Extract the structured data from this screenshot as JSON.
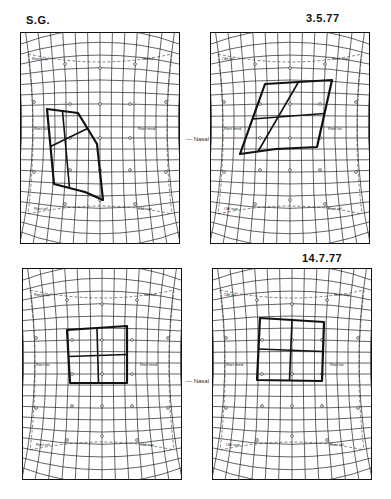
{
  "figure": {
    "subject_label": "S.G.",
    "top_left_title": "S.G.",
    "top_right_title": "3.5.77",
    "bottom_left_title": "",
    "bottom_right_title": "14.7.77",
    "nasal_label_top": "Nasal",
    "nasal_label_bottom": "Nasal"
  },
  "muscle_labels": {
    "rect_sup": "Rect sup",
    "obl_inf": "Obl inf",
    "rect_lat": "Rect lat",
    "rect_med": "Rect med",
    "obl_sup": "Obl sup",
    "rect_inf": "Rect inf"
  },
  "panels": [
    {
      "id": "top-left",
      "title": "S.G.",
      "labels": {
        "tl": "Rect sup",
        "tr": "Obl inf",
        "ml": "Rect lat",
        "mr": "Rect med",
        "bl": "Rect inf",
        "br": "Obl sup"
      },
      "plot": [
        [
          27,
          77
        ],
        [
          58,
          81
        ],
        [
          77,
          112
        ],
        [
          83,
          168
        ],
        [
          65,
          160
        ],
        [
          34,
          152
        ]
      ],
      "color": "#111111"
    },
    {
      "id": "top-right",
      "title": "3.5.77",
      "labels": {
        "tl": "Obl inf",
        "tr": "Rect sup",
        "ml": "Rect med",
        "mr": "Rect lat",
        "bl": "Obl sup",
        "br": "Rect inf"
      },
      "plot": [
        [
          55,
          52
        ],
        [
          122,
          48
        ],
        [
          107,
          115
        ],
        [
          66,
          117
        ],
        [
          30,
          122
        ]
      ],
      "color": "#111111"
    },
    {
      "id": "bottom-left",
      "title": "",
      "labels": {
        "tl": "Rect sup",
        "tr": "Obl inf",
        "ml": "Rect lat",
        "mr": "Rect med",
        "bl": "Rect inf",
        "br": "Obl sup"
      },
      "plot": [
        [
          45,
          62
        ],
        [
          105,
          58
        ],
        [
          105,
          115
        ],
        [
          48,
          115
        ]
      ],
      "color": "#111111"
    },
    {
      "id": "bottom-right",
      "title": "14.7.77",
      "labels": {
        "tl": "Obl inf",
        "tr": "Rect sup",
        "ml": "Rect med",
        "mr": "Rect lat",
        "bl": "Obl sup",
        "br": "Rect inf"
      },
      "plot": [
        [
          48,
          50
        ],
        [
          112,
          54
        ],
        [
          110,
          113
        ],
        [
          45,
          112
        ]
      ],
      "color": "#111111"
    }
  ]
}
